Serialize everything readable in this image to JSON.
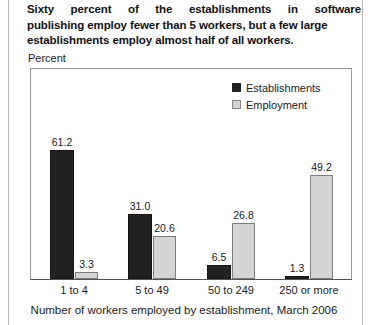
{
  "title": {
    "line1": "Sixty percent of the establishments in software",
    "line2": "publishing employ fewer than 5 workers, but a few large",
    "line3": "establishments employ almost half of all workers."
  },
  "y_axis_label": "Percent",
  "axis_title": "Number of workers employed by establishment, March 2006",
  "legend": {
    "items": [
      {
        "label": "Establishments",
        "color": "#222222",
        "swatch": "dark"
      },
      {
        "label": "Employment",
        "color": "#d4d4d4",
        "swatch": "light"
      }
    ]
  },
  "chart_data": {
    "type": "bar",
    "title": "Sixty percent of the establishments in software publishing employ fewer than 5 workers, but a few large establishments employ almost half of all workers.",
    "xlabel": "Number of workers employed by establishment, March 2006",
    "ylabel": "Percent",
    "ylim": [
      0,
      65
    ],
    "grid": false,
    "legend_position": "top-right",
    "categories": [
      "1 to 4",
      "5 to 49",
      "50 to 249",
      "250 or more"
    ],
    "series": [
      {
        "name": "Establishments",
        "color": "#222222",
        "values": [
          61.2,
          31.0,
          6.5,
          1.3
        ]
      },
      {
        "name": "Employment",
        "color": "#d4d4d4",
        "values": [
          3.3,
          20.6,
          26.8,
          49.2
        ]
      }
    ],
    "data_labels": {
      "Establishments": [
        "61.2",
        "31.0",
        "6.5",
        "1.3"
      ],
      "Employment": [
        "3.3",
        "20.6",
        "26.8",
        "49.2"
      ]
    }
  }
}
